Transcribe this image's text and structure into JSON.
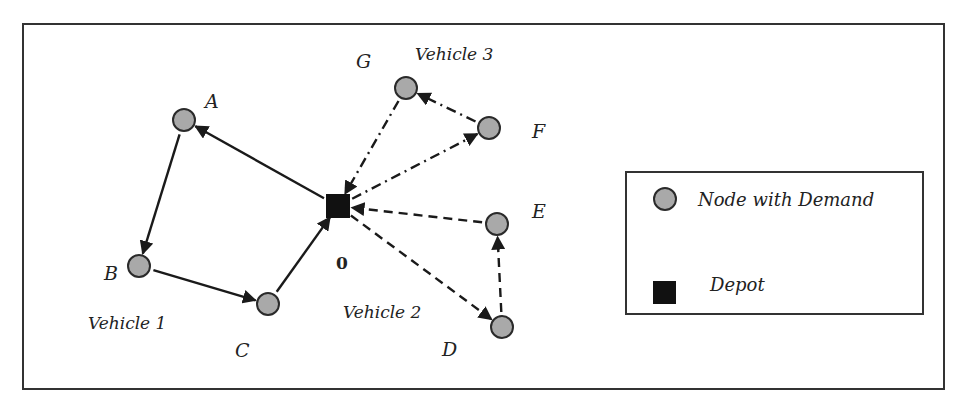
{
  "diagram": {
    "colors": {
      "node_fill": "#a9a9a9",
      "node_stroke": "#2a2a2a",
      "depot_fill": "#111111",
      "edge": "#1a1a1a",
      "frame": "#333333"
    },
    "depot": {
      "id": "0",
      "label": "0"
    },
    "nodes": [
      {
        "id": "A",
        "label": "A"
      },
      {
        "id": "B",
        "label": "B"
      },
      {
        "id": "C",
        "label": "C"
      },
      {
        "id": "D",
        "label": "D"
      },
      {
        "id": "E",
        "label": "E"
      },
      {
        "id": "F",
        "label": "F"
      },
      {
        "id": "G",
        "label": "G"
      }
    ],
    "routes": [
      {
        "vehicle": "Vehicle 1",
        "style": "solid",
        "path": [
          "0",
          "A",
          "B",
          "C",
          "0"
        ]
      },
      {
        "vehicle": "Vehicle 2",
        "style": "dashed",
        "path": [
          "0",
          "D",
          "E",
          "0"
        ]
      },
      {
        "vehicle": "Vehicle 3",
        "style": "dash-dot",
        "path": [
          "0",
          "F",
          "G",
          "0"
        ]
      }
    ],
    "vehicle_labels": {
      "v1": "Vehicle 1",
      "v2": "Vehicle 2",
      "v3": "Vehicle 3"
    },
    "legend": {
      "node_label": "Node with Demand",
      "depot_label": "Depot"
    }
  }
}
